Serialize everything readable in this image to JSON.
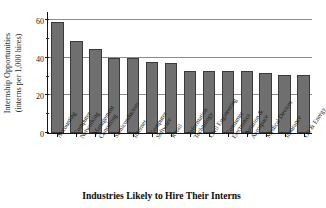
{
  "chart_data": {
    "type": "bar",
    "title": "",
    "xlabel": "Industries Likely to Hire Their Interns",
    "ylabel": "Internship Opportunities (interns per 1,000 hires)",
    "ylabel_line1": "Internship Opportunities",
    "ylabel_line2": "(interns per 1,000 hires)",
    "categories": [
      "Accounting",
      "Computer Networking",
      "Management Consulting",
      "Semiconductors",
      "Internet",
      "Computer Software",
      "Retail",
      "Information Technology",
      "Civil Engineering",
      "Consumer Electronics",
      "Aviation & Aerospace",
      "Medical Devices",
      "Insurance",
      "Oil & Energy"
    ],
    "category_lines": [
      [
        "Accounting"
      ],
      [
        "Computer",
        "Networking"
      ],
      [
        "Management",
        "Consulting"
      ],
      [
        "Semiconductors"
      ],
      [
        "Internet"
      ],
      [
        "Computer",
        "Software"
      ],
      [
        "Retail"
      ],
      [
        "Information",
        "Technology"
      ],
      [
        "Civil Engineering"
      ],
      [
        "Consumer",
        "Electronics"
      ],
      [
        "Aviation &",
        "Aerospace"
      ],
      [
        "Medical Devices"
      ],
      [
        "Insurance"
      ],
      [
        "Oil & Energy"
      ]
    ],
    "values": [
      59,
      49,
      45,
      40,
      40,
      38,
      37.5,
      33,
      33,
      33,
      33,
      32,
      31,
      31
    ],
    "ylim": [
      0,
      65
    ],
    "yticks": [
      0,
      20,
      40,
      60
    ],
    "ytick_labels": [
      "0",
      "20",
      "40",
      "60"
    ],
    "yminor_ticks": [
      10,
      30,
      50
    ],
    "gridlines": [
      20,
      40,
      60
    ],
    "grid": true,
    "legend": "none",
    "bar_color": "#6f6f6f",
    "bar_edge_color": "#3a3a3a",
    "axis_color": "#151515",
    "grid_color": "#8c8c8c",
    "background": "#ffffff"
  }
}
